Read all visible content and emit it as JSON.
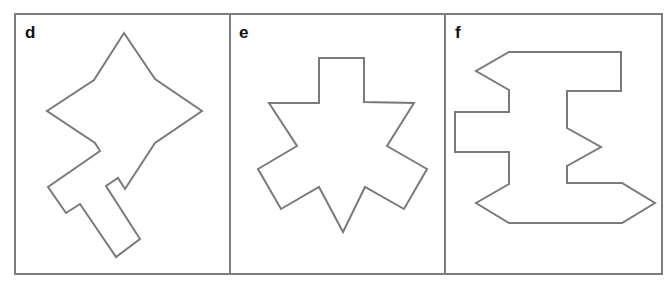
{
  "figure": {
    "panels": [
      {
        "id": "d",
        "label": "d",
        "shape_description": "Four-pointed star-like polygon with a T-shaped stem extending to the lower-left",
        "points": "124,33 155,79 202,111 155,143 125,189 118,178 106,186 140,239 116,257 80,204 66,213 48,187 100,151 95,143 47,111 94,80"
      },
      {
        "id": "e",
        "label": "e",
        "shape_description": "Six-armed star polygon with a rectangular top arm",
        "points": "319,58 364,58 364,102 414,103 387,146 427,169 404,209 365,187 343,232 319,187 281,209 258,169 297,146 269,103 319,103"
      },
      {
        "id": "f",
        "label": "f",
        "shape_description": "Blocky I-beam / sigma-like polygon with notches and pointed ends",
        "points": "509,52 621,52 621,91 567,91 567,128 601,147 567,166 567,183 622,183 655,203 622,223 509,223 476,203 509,184 509,152 455,152 455,112 509,112 509,90 476,71"
      }
    ],
    "colors": {
      "outline": "#7a7a7a",
      "frame": "#7d7d7d",
      "label": "#111111",
      "background": "#ffffff"
    }
  }
}
